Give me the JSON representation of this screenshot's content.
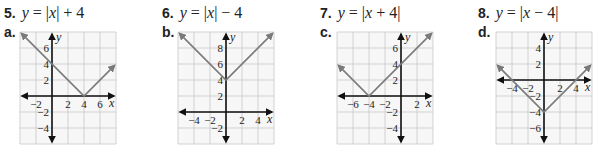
{
  "problems": [
    {
      "number": "5.",
      "equation": "y = |x| + 4",
      "eq_parts": [
        "y",
        " = |",
        "x",
        "| + 4"
      ],
      "answer_letter": "a."
    },
    {
      "number": "6.",
      "equation": "y = |x| − 4",
      "eq_parts": [
        "y",
        " = |",
        "x",
        "| − 4"
      ],
      "answer_letter": "b."
    },
    {
      "number": "7.",
      "equation": "y = |x + 4|",
      "eq_parts": [
        "y",
        " = |",
        "x",
        " + 4|"
      ],
      "answer_letter": "c."
    },
    {
      "number": "8.",
      "equation": "y = |x − 4|",
      "eq_parts": [
        "y",
        " = |",
        "x",
        " − 4|"
      ],
      "answer_letter": "d."
    }
  ],
  "colors": {
    "grid": "#c8c8c8",
    "axis": "#111111",
    "curve": "#7a7a7a",
    "grid_bg": "#f7f7f7"
  },
  "chart_data": [
    {
      "type": "line",
      "label": "a.",
      "title": "y = |x − 4|",
      "xlabel": "x",
      "ylabel": "y",
      "xlim": [
        -4,
        8
      ],
      "ylim": [
        -6,
        8
      ],
      "grid": true,
      "xticks": [
        -2,
        2,
        4,
        6
      ],
      "yticks": [
        6,
        4,
        2,
        -2,
        -4
      ],
      "series": [
        {
          "name": "graph",
          "x": [
            -4,
            4,
            8
          ],
          "y": [
            8,
            0,
            4
          ]
        }
      ],
      "vertex": [
        4,
        0
      ]
    },
    {
      "type": "line",
      "label": "b.",
      "title": "y = |x| + 4",
      "xlabel": "x",
      "ylabel": "y",
      "xlim": [
        -6,
        6
      ],
      "ylim": [
        -4,
        10
      ],
      "grid": true,
      "xticks": [
        -4,
        -2,
        2,
        4
      ],
      "yticks": [
        8,
        6,
        4,
        2,
        -2
      ],
      "series": [
        {
          "name": "graph",
          "x": [
            -6,
            0,
            6
          ],
          "y": [
            10,
            4,
            10
          ]
        }
      ],
      "vertex": [
        0,
        4
      ]
    },
    {
      "type": "line",
      "label": "c.",
      "title": "y = |x + 4|",
      "xlabel": "x",
      "ylabel": "y",
      "xlim": [
        -8,
        4
      ],
      "ylim": [
        -6,
        8
      ],
      "grid": true,
      "xticks": [
        -6,
        -4,
        -2,
        2
      ],
      "yticks": [
        6,
        4,
        2,
        -2,
        -4
      ],
      "series": [
        {
          "name": "graph",
          "x": [
            -8,
            -4,
            4
          ],
          "y": [
            4,
            0,
            8
          ]
        }
      ],
      "vertex": [
        -4,
        0
      ]
    },
    {
      "type": "line",
      "label": "d.",
      "title": "y = |x| − 4",
      "xlabel": "x",
      "ylabel": "y",
      "xlim": [
        -6,
        6
      ],
      "ylim": [
        -8,
        6
      ],
      "grid": true,
      "xticks": [
        -4,
        -2,
        2,
        4
      ],
      "yticks": [
        4,
        2,
        -2,
        -4,
        -6
      ],
      "series": [
        {
          "name": "graph",
          "x": [
            -6,
            0,
            6
          ],
          "y": [
            2,
            -4,
            2
          ]
        }
      ],
      "vertex": [
        0,
        -4
      ]
    }
  ],
  "layout": [
    {
      "left": 4,
      "title_left": 4,
      "grid_x": 20,
      "grid_y": 32,
      "scale": 8
    },
    {
      "left": 160,
      "title_left": 162,
      "grid_x": 178,
      "grid_y": 32,
      "scale": 8
    },
    {
      "left": 318,
      "title_left": 320,
      "grid_x": 337,
      "grid_y": 32,
      "scale": 8
    },
    {
      "left": 476,
      "title_left": 478,
      "grid_x": 496,
      "grid_y": 32,
      "scale": 8
    }
  ]
}
